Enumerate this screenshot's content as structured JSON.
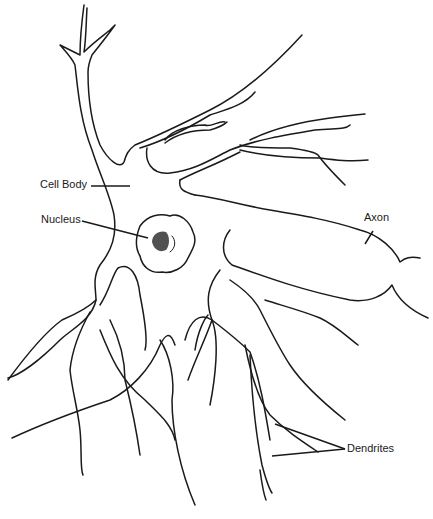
{
  "diagram": {
    "labels": {
      "cell_body": "Cell Body",
      "nucleus": "Nucleus",
      "axon": "Axon",
      "dendrites": "Dendrites"
    },
    "colors": {
      "line": "#1a1a1a",
      "background": "#ffffff",
      "nucleolus": "#333333"
    }
  }
}
